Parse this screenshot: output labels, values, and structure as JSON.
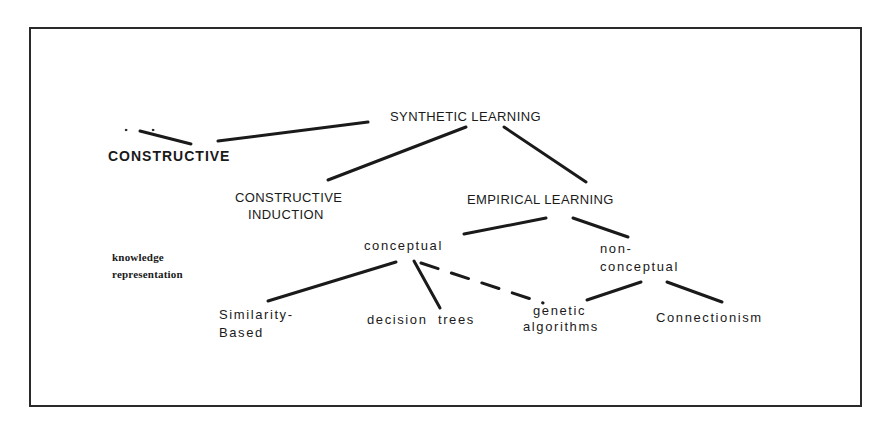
{
  "diagram": {
    "nodes": {
      "synthetic": {
        "label": "SYNTHETIC LEARNING"
      },
      "constructive": {
        "label": "CONSTRUCTIVE"
      },
      "constructive_induction": {
        "line1": "CONSTRUCTIVE",
        "line2": "INDUCTION"
      },
      "empirical": {
        "label": "EMPIRICAL LEARNING"
      },
      "conceptual": {
        "label": "conceptual"
      },
      "nonconceptual": {
        "line1": "non-",
        "line2": "conceptual"
      },
      "similarity": {
        "line1": "Similarity-",
        "line2": "Based"
      },
      "decision_trees": {
        "label": "decision  trees"
      },
      "genetic": {
        "line1": "genetic",
        "line2": "algorithms"
      },
      "connectionism": {
        "label": "Connectionism"
      }
    },
    "side_note": {
      "line1": "knowledge",
      "line2": "representation"
    },
    "edges": [
      {
        "from": "synthetic",
        "to": "constructive",
        "style": "solid"
      },
      {
        "from": "synthetic",
        "to": "constructive_induction",
        "style": "solid"
      },
      {
        "from": "synthetic",
        "to": "empirical",
        "style": "solid"
      },
      {
        "from": "empirical",
        "to": "conceptual",
        "style": "solid"
      },
      {
        "from": "empirical",
        "to": "nonconceptual",
        "style": "solid"
      },
      {
        "from": "conceptual",
        "to": "similarity",
        "style": "solid"
      },
      {
        "from": "conceptual",
        "to": "decision_trees",
        "style": "solid"
      },
      {
        "from": "conceptual",
        "to": "genetic",
        "style": "dashed"
      },
      {
        "from": "nonconceptual",
        "to": "genetic",
        "style": "solid"
      },
      {
        "from": "nonconceptual",
        "to": "connectionism",
        "style": "solid"
      }
    ],
    "line_color": "#1a1a1a"
  }
}
